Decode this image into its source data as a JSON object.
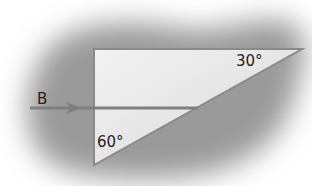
{
  "diagram": {
    "type": "prism-ray-diagram",
    "ray_label": "B",
    "angle_top": "30°",
    "angle_bottom": "60°",
    "colors": {
      "background": "#ffffff",
      "shadow": "#9a9a9a",
      "prism_fill": "#eeeeee",
      "prism_stroke": "#8a8a8a",
      "ray": "#7f7f7f",
      "text": "#222222"
    }
  }
}
